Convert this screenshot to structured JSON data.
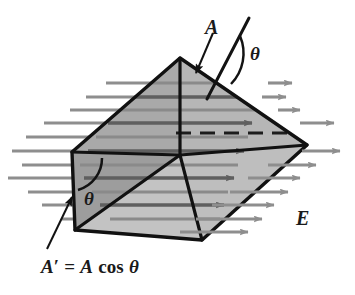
{
  "figure": {
    "type": "physics-diagram",
    "background_color": "#ffffff"
  },
  "labels": {
    "area_vector": "A",
    "angle_top": "θ",
    "angle_left": "θ",
    "field": "E",
    "projected_area_prefix": "A",
    "projected_area_prime": "′",
    "projected_area_equals": "=",
    "projected_area_A": "A",
    "projected_area_cos": "cos",
    "projected_area_theta": "θ",
    "projected_area_full": "A′ = A cos θ"
  },
  "colors": {
    "outline": "#111111",
    "face_top_left": "#a9a9a9",
    "face_top_right": "#b4b4b4",
    "face_front_left": "#9c9c9c",
    "face_front_lower": "#c2c2c2",
    "face_right": "#bdbdbd",
    "field_line": "#8e8e8e",
    "field_line_dark": "#6f6f6f",
    "label_text": "#1a1a1a",
    "background": "#ffffff"
  },
  "geometry": {
    "apex": [
      180,
      58
    ],
    "left_top": [
      72,
      152
    ],
    "left_bottom": [
      75,
      230
    ],
    "bottom": [
      202,
      240
    ],
    "right": [
      307,
      145
    ],
    "inner_ridge": [
      180,
      155
    ]
  },
  "field_lines": {
    "count": 11,
    "direction": "left-to-right",
    "arrowheads": "right-end",
    "y_positions": [
      83,
      97,
      110,
      123,
      137,
      151,
      165,
      178,
      192,
      205,
      219
    ]
  },
  "annotations": {
    "normal_line": "surface normal through face A",
    "angle_arc_top": "angle between normal and field direction",
    "angle_arc_left": "angle theta at left triangular face",
    "dashed_line": "hidden edge / field line inside prism",
    "pointer_A": "arrow from label A to the inclined face",
    "pointer_Aprime": "arrow from label A prime to the left face"
  }
}
